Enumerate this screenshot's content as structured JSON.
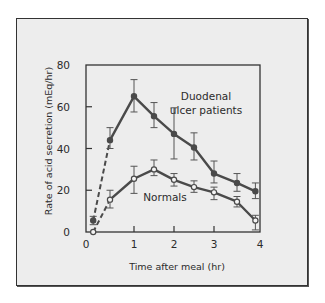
{
  "chart_data": {
    "type": "line",
    "title": "",
    "xlabel": "Time after meal (hr)",
    "ylabel": "Rate of acid secretion (mEq/hr)",
    "xlim": [
      0,
      4
    ],
    "ylim": [
      0,
      80
    ],
    "xticks": [
      0,
      1,
      2,
      3,
      4
    ],
    "yticks": [
      0,
      20,
      40,
      60,
      80
    ],
    "grid": false,
    "legend": "none (inline annotations)",
    "series": [
      {
        "name": "Duodenal ulcer patients",
        "label_lines": [
          "Duodenal",
          "ulcer patients"
        ],
        "marker": "filled-circle",
        "dashed_first_segment": true,
        "x": [
          0.15,
          0.5,
          1.0,
          1.5,
          2.0,
          2.5,
          3.0,
          3.5,
          3.9
        ],
        "y": [
          5.5,
          44,
          65,
          55.5,
          47,
          40.5,
          28,
          23.5,
          19.5
        ],
        "y_err_low": [
          3.5,
          40,
          57.5,
          50,
          35,
          34.5,
          23.5,
          19.5,
          16
        ],
        "y_err_high": [
          7.5,
          50,
          73,
          62,
          59.5,
          47.5,
          34,
          28,
          23.5
        ]
      },
      {
        "name": "Normals",
        "label_lines": [
          "Normals"
        ],
        "marker": "open-circle",
        "dashed_first_segment": true,
        "x": [
          0.15,
          0.5,
          1.0,
          1.5,
          2.0,
          2.5,
          3.0,
          3.5,
          3.9
        ],
        "y": [
          0,
          15.5,
          25.5,
          30,
          25,
          21.5,
          19,
          14.5,
          5.5
        ],
        "y_err_low": [
          0,
          11.5,
          18.5,
          27,
          22,
          19,
          15.5,
          12,
          1
        ],
        "y_err_high": [
          0,
          20,
          31.5,
          34.5,
          28,
          24.5,
          21.5,
          17,
          8
        ]
      }
    ]
  },
  "colors": {
    "panel_background": "#ededed",
    "line": "#4a4a4a",
    "text": "#2b2b2b"
  }
}
